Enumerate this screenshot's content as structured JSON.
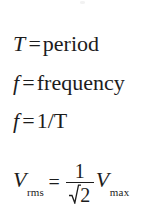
{
  "document": {
    "kind": "scanned-formula-sheet",
    "background_color": "#ffffff",
    "text_color": "#1c1c1c"
  },
  "formulas": [
    {
      "id": "period-definition",
      "lhs_symbol": "T",
      "operator": "=",
      "rhs_text": "period",
      "full_text": "T = period"
    },
    {
      "id": "frequency-definition",
      "lhs_symbol": "f",
      "operator": "=",
      "rhs_text": "frequency",
      "full_text": "f = frequency"
    },
    {
      "id": "frequency-equation",
      "lhs_symbol": "f",
      "operator": "=",
      "rhs_text": "1/T",
      "full_text": "f = 1/T"
    },
    {
      "id": "rms-voltage-equation",
      "lhs_symbol": "V",
      "lhs_subscript": "rms",
      "operator": "=",
      "fraction_numerator": "1",
      "fraction_denominator_radicand": "2",
      "rhs_symbol": "V",
      "rhs_subscript": "max",
      "full_text": "V_rms = 1/sqrt(2) V_max"
    }
  ],
  "artifacts": {
    "top_speck": "scan-speck",
    "bottom_clip": "sqrt-2-denominator-clipped-at-bottom-edge"
  }
}
